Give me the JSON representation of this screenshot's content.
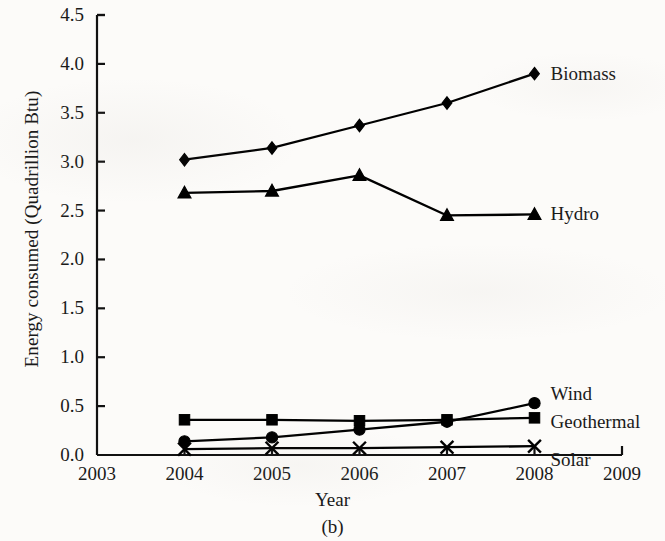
{
  "chart_data": {
    "type": "line",
    "title": "",
    "caption": "(b)",
    "xlabel": "Year",
    "ylabel": "Energy consumed (Quadrillion Btu)",
    "x": [
      2004,
      2005,
      2006,
      2007,
      2008
    ],
    "xlim": [
      2003,
      2009
    ],
    "ylim": [
      0.0,
      4.5
    ],
    "xticks": [
      "2003",
      "2004",
      "2005",
      "2006",
      "2007",
      "2008",
      "2009"
    ],
    "yticks": [
      "0.0",
      "0.5",
      "1.0",
      "1.5",
      "2.0",
      "2.5",
      "3.0",
      "3.5",
      "4.0",
      "4.5"
    ],
    "grid": false,
    "legend_position": "inline-right",
    "series": [
      {
        "name": "Biomass",
        "marker": "diamond",
        "color": "#000000",
        "values": [
          3.02,
          3.14,
          3.37,
          3.6,
          3.9
        ]
      },
      {
        "name": "Hydro",
        "marker": "triangle",
        "color": "#000000",
        "values": [
          2.68,
          2.7,
          2.86,
          2.45,
          2.46
        ]
      },
      {
        "name": "Wind",
        "marker": "circle",
        "color": "#000000",
        "values": [
          0.14,
          0.18,
          0.26,
          0.34,
          0.53
        ]
      },
      {
        "name": "Geothermal",
        "marker": "square",
        "color": "#000000",
        "values": [
          0.36,
          0.36,
          0.35,
          0.36,
          0.38
        ]
      },
      {
        "name": "Solar",
        "marker": "x",
        "color": "#000000",
        "values": [
          0.06,
          0.07,
          0.07,
          0.08,
          0.09
        ]
      }
    ]
  }
}
